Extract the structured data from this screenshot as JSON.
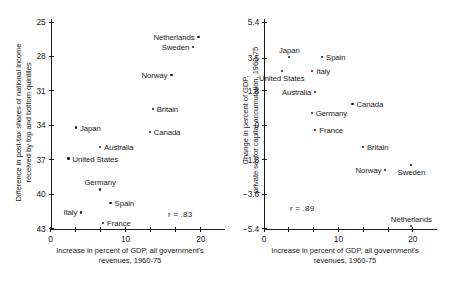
{
  "figure": {
    "width": 456,
    "height": 281,
    "ink_color": "#1b1b1b",
    "background": "#ffffff"
  },
  "chart_data": [
    {
      "type": "scatter",
      "panel": "left",
      "title": "",
      "xlabel": "Increase in percent of GDP, all government's revenues, 1960-75",
      "xlabel_lines": [
        "Increase in percent of GDP, all government's",
        "revenues, 1960-75"
      ],
      "ylabel": "Difference in post-tax shares of national income received by top and bottom quintiles",
      "ylabel_lines": [
        "Difference in post-tax shares of national income",
        "received by top and bottom quintiles"
      ],
      "xlim": [
        0,
        21.5
      ],
      "ylim": [
        25,
        43
      ],
      "y_inverted": true,
      "xticks": [
        0,
        10,
        20
      ],
      "xticklabels": [
        "0",
        "10",
        "20"
      ],
      "xminorticks": [
        3.33,
        6.67,
        13.33,
        16.67
      ],
      "yticks": [
        25,
        28,
        31,
        34,
        37,
        40,
        43
      ],
      "yticklabels": [
        "25",
        "28",
        "31",
        "34",
        "37",
        "40",
        "43"
      ],
      "grid": false,
      "legend": "none",
      "annotation": "r  =  .83",
      "annotation_value": 0.83,
      "points": [
        {
          "name": "Netherlands",
          "x": 19.7,
          "y": 26.3,
          "label_side": "r"
        },
        {
          "name": "Sweden",
          "x": 19.0,
          "y": 27.2,
          "label_side": "r"
        },
        {
          "name": "Norway",
          "x": 16.1,
          "y": 29.6,
          "label_side": "r"
        },
        {
          "name": "Britain",
          "x": 13.6,
          "y": 32.6,
          "label_side": "l"
        },
        {
          "name": "Japan",
          "x": 3.4,
          "y": 34.2,
          "label_side": "l"
        },
        {
          "name": "Canada",
          "x": 13.2,
          "y": 34.6,
          "label_side": "l"
        },
        {
          "name": "Australia",
          "x": 6.6,
          "y": 35.9,
          "label_side": "l"
        },
        {
          "name": "United States",
          "x": 2.4,
          "y": 36.9,
          "label_side": "l"
        },
        {
          "name": "Germany",
          "x": 6.6,
          "y": 39.6,
          "label_side": "c"
        },
        {
          "name": "Spain",
          "x": 8.0,
          "y": 40.8,
          "label_side": "l"
        },
        {
          "name": "Italy",
          "x": 4.1,
          "y": 41.6,
          "label_side": "r"
        },
        {
          "name": "France",
          "x": 7.0,
          "y": 42.5,
          "label_side": "l"
        }
      ]
    },
    {
      "type": "scatter",
      "panel": "right",
      "title": "",
      "xlabel": "Increase in percent of GDP, all government's revenues, 1960-75",
      "xlabel_lines": [
        "Increase in percent of GDP, all government's",
        "revenues, 1960-75"
      ],
      "ylabel": "Change in percent of GDP, private sector capital accumulation, 1960-75",
      "ylabel_lines": [
        "Change in percent of GDP,",
        "private sector capital accumulation, 1960-75"
      ],
      "xlim": [
        0,
        21.5
      ],
      "ylim": [
        -5.4,
        5.4
      ],
      "y_inverted": false,
      "xticks": [
        0,
        10,
        20
      ],
      "xticklabels": [
        "0",
        "10",
        "20"
      ],
      "xminorticks": [
        3.33,
        6.67,
        13.33,
        16.67
      ],
      "yticks": [
        5.4,
        3.5,
        1.8,
        0,
        -1.8,
        -3.6,
        -5.4
      ],
      "yticklabels": [
        "5.4",
        "3.5",
        "1.8",
        "0",
        "−1.8",
        "−3.6",
        "−5.4"
      ],
      "grid": false,
      "legend": "none",
      "annotation": "r  =  .89",
      "annotation_value": 0.89,
      "points": [
        {
          "name": "Japan",
          "x": 3.4,
          "y": 3.55,
          "label_side": "above"
        },
        {
          "name": "Spain",
          "x": 7.8,
          "y": 3.55,
          "label_side": "l"
        },
        {
          "name": "Italy",
          "x": 6.5,
          "y": 2.85,
          "label_side": "l"
        },
        {
          "name": "United States",
          "x": 2.4,
          "y": 2.85,
          "label_side": "below"
        },
        {
          "name": "Australia",
          "x": 6.9,
          "y": 1.75,
          "label_side": "r"
        },
        {
          "name": "Canada",
          "x": 11.9,
          "y": 1.1,
          "label_side": "l"
        },
        {
          "name": "Germany",
          "x": 6.4,
          "y": 0.65,
          "label_side": "l"
        },
        {
          "name": "France",
          "x": 6.9,
          "y": -0.25,
          "label_side": "l"
        },
        {
          "name": "Britain",
          "x": 13.3,
          "y": -1.15,
          "label_side": "l"
        },
        {
          "name": "Norway",
          "x": 16.3,
          "y": -2.35,
          "label_side": "r"
        },
        {
          "name": "Sweden",
          "x": 19.8,
          "y": -2.1,
          "label_side": "below"
        },
        {
          "name": "Netherlands",
          "x": 19.8,
          "y": -5.25,
          "label_side": "above"
        }
      ]
    }
  ]
}
